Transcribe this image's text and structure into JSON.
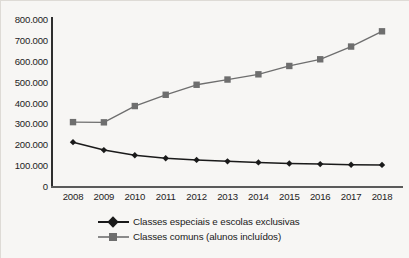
{
  "chart_data": {
    "type": "line",
    "title": "",
    "subtitle": "",
    "xlabel": "",
    "ylabel": "",
    "categories": [
      "2008",
      "2009",
      "2010",
      "2011",
      "2012",
      "2013",
      "2014",
      "2015",
      "2016",
      "2017",
      "2018"
    ],
    "x": [
      2008,
      2009,
      2010,
      2011,
      2012,
      2013,
      2014,
      2015,
      2016,
      2017,
      2018
    ],
    "ylim": [
      0,
      800000
    ],
    "y_ticks": [
      0,
      100000,
      200000,
      300000,
      400000,
      500000,
      600000,
      700000,
      800000
    ],
    "y_tick_labels": [
      "0",
      "100.000",
      "200.000",
      "300.000",
      "400.000",
      "500.000",
      "600.000",
      "700.000",
      "800.000"
    ],
    "grid": false,
    "legend_position": "bottom",
    "series": [
      {
        "name": "Classes especiais e escolas exclusivas",
        "marker": "diamond",
        "color": "#1a1a1a",
        "values": [
          210000,
          172000,
          147000,
          133000,
          125000,
          118000,
          113000,
          108000,
          105000,
          102000,
          101000
        ]
      },
      {
        "name": "Classes comuns (alunos incluídos)",
        "marker": "square",
        "color": "#6e6e6e",
        "values": [
          306000,
          305000,
          383000,
          437000,
          485000,
          510000,
          535000,
          575000,
          607000,
          668000,
          741000
        ]
      }
    ]
  },
  "axes": {
    "y_labels": [
      "800.000",
      "700.000",
      "600.000",
      "500.000",
      "400.000",
      "300.000",
      "200.000",
      "100.000",
      "0"
    ],
    "x_labels": [
      "2008",
      "2009",
      "2010",
      "2011",
      "2012",
      "2013",
      "2014",
      "2015",
      "2016",
      "2017",
      "2018"
    ]
  },
  "legend": {
    "items": [
      {
        "label": "Classes especiais e escolas exclusivas",
        "marker": "diamond-marker",
        "color": "#1a1a1a"
      },
      {
        "label": "Classes comuns (alunos incluídos)",
        "marker": "square-marker",
        "color": "#6e6e6e"
      }
    ]
  },
  "colors": {
    "background": "#f7f6f4",
    "axis": "#2e2e2e",
    "series_special": "#1a1a1a",
    "series_common": "#6e6e6e",
    "text": "#1d1d1d"
  }
}
